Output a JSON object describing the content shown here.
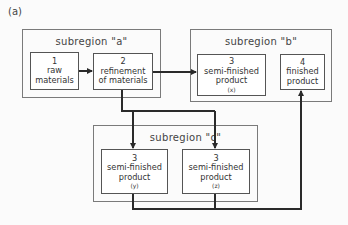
{
  "figure_label": "(a)",
  "regions": {
    "a": {
      "title": "subregion \"a\""
    },
    "b": {
      "title": "subregion \"b\""
    },
    "c": {
      "title": "subregion \"c\""
    }
  },
  "nodes": {
    "raw": {
      "number": "1",
      "line1": "raw",
      "line2": "materials"
    },
    "refine": {
      "number": "2",
      "line1": "refinement",
      "line2": "of materials"
    },
    "semi_x": {
      "number": "3",
      "line1": "semi-finished",
      "line2": "product",
      "tag": "(x)"
    },
    "finished": {
      "number": "4",
      "line1": "finished",
      "line2": "product"
    },
    "semi_y": {
      "number": "3",
      "line1": "semi-finished",
      "line2": "product",
      "tag": "(y)"
    },
    "semi_z": {
      "number": "3",
      "line1": "semi-finished",
      "line2": "product",
      "tag": "(z)"
    }
  },
  "colors": {
    "line": "#2a2a2a",
    "border": "#7a7a7a"
  }
}
